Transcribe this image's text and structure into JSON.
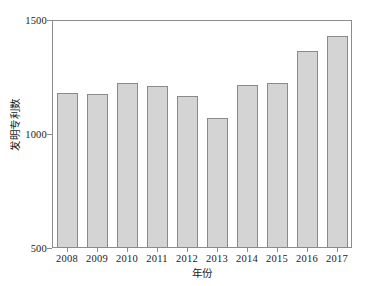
{
  "chart_data": {
    "type": "bar",
    "title": "",
    "xlabel": "年份",
    "ylabel": "发明专利数",
    "categories": [
      "2008",
      "2009",
      "2010",
      "2011",
      "2012",
      "2013",
      "2014",
      "2015",
      "2016",
      "2017"
    ],
    "values": [
      1180,
      1175,
      1222,
      1210,
      1168,
      1068,
      1215,
      1222,
      1365,
      1430
    ],
    "ylim": [
      500,
      1500
    ],
    "yticks": [
      500,
      1000,
      1500
    ],
    "ytick_labels": [
      "500",
      "1000",
      "1500"
    ],
    "grid": false,
    "legend": false,
    "legend_position": "none",
    "bar_fill_color": "#d4d4d4",
    "bar_edge_color": "#8a8a8a",
    "axis_color": "#8c8c8c"
  }
}
